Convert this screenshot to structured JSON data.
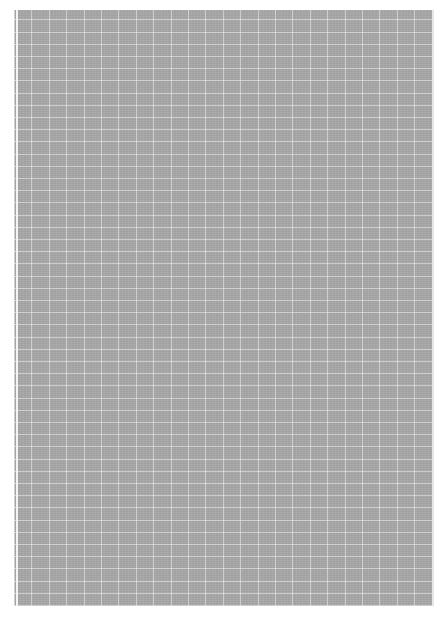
{
  "page": {
    "background_color": "#ffffff",
    "sheet_color": "#a8a8a8",
    "grid_line_color": "#d8d8d8"
  }
}
